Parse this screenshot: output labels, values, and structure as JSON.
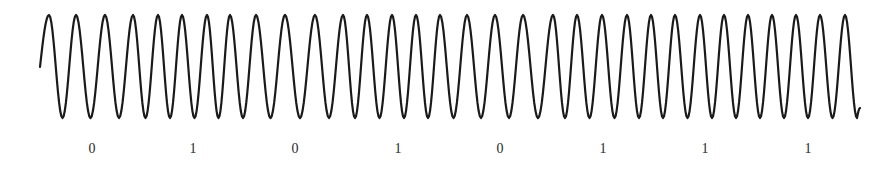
{
  "figure": {
    "kind": "FSK waveform",
    "stroke_color": "#1a1a1a",
    "label_color": "#2a2a2a",
    "background": "#ffffff"
  },
  "waveform": {
    "start": [
      40,
      67
    ],
    "end": [
      860,
      108
    ],
    "center_y": 66.5,
    "peak_y": 15,
    "trough_y": 118,
    "peaks_x": [
      49,
      76,
      105,
      133,
      158,
      182,
      207,
      230,
      256,
      285,
      315,
      343,
      367,
      392,
      416,
      440,
      467,
      495,
      523,
      553,
      577,
      602,
      627,
      651,
      675,
      700,
      724,
      748,
      772,
      796,
      820,
      845
    ]
  },
  "bits": [
    {
      "value": "0",
      "x": 92
    },
    {
      "value": "1",
      "x": 193
    },
    {
      "value": "0",
      "x": 295
    },
    {
      "value": "1",
      "x": 398
    },
    {
      "value": "0",
      "x": 500
    },
    {
      "value": "1",
      "x": 603
    },
    {
      "value": "1",
      "x": 705
    },
    {
      "value": "1",
      "x": 808
    }
  ]
}
